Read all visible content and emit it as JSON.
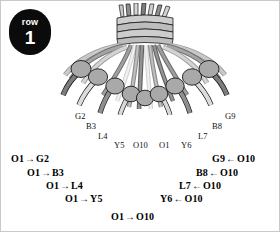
{
  "badge": {
    "word": "row",
    "number": "1"
  },
  "illustration": {
    "name": "friendship-bracelet-knot-fan-diagram",
    "colors": {
      "outline": "#1a1a1a",
      "strand_light": "#d9d9d9",
      "strand_mid": "#9a9a9a",
      "strand_dark": "#6e6e6e",
      "knot_fill": "#a8a8a8",
      "wrap_fill": "#cfcfcf"
    }
  },
  "thread_labels": [
    {
      "text": "G2",
      "x": 74,
      "y": 114
    },
    {
      "text": "B3",
      "x": 85,
      "y": 124
    },
    {
      "text": "L4",
      "x": 97,
      "y": 134
    },
    {
      "text": "Y5",
      "x": 114,
      "y": 143
    },
    {
      "text": "O10",
      "x": 134,
      "y": 143
    },
    {
      "text": "O1",
      "x": 159,
      "y": 143
    },
    {
      "text": "Y6",
      "x": 181,
      "y": 143
    },
    {
      "text": "L7",
      "x": 198,
      "y": 134
    },
    {
      "text": "B8",
      "x": 212,
      "y": 124
    },
    {
      "text": "G9",
      "x": 225,
      "y": 113
    }
  ],
  "instructions_left": [
    {
      "from": "O1",
      "arrow": "→",
      "to": "G2",
      "x": 10,
      "y": 156
    },
    {
      "from": "O1",
      "arrow": "→",
      "to": "B3",
      "x": 26,
      "y": 170
    },
    {
      "from": "O1",
      "arrow": "→",
      "to": "L4",
      "x": 45,
      "y": 183
    },
    {
      "from": "O1",
      "arrow": "→",
      "to": "Y5",
      "x": 64,
      "y": 196
    },
    {
      "from": "O1",
      "arrow": "→",
      "to": "O10",
      "x": 111,
      "y": 214
    }
  ],
  "instructions_right": [
    {
      "from": "G9",
      "arrow": "←",
      "to": "O10",
      "x": 212,
      "y": 156
    },
    {
      "from": "B8",
      "arrow": "←",
      "to": "O10",
      "x": 196,
      "y": 170
    },
    {
      "from": "L7",
      "arrow": "←",
      "to": "O10",
      "x": 179,
      "y": 183
    },
    {
      "from": "Y6",
      "arrow": "←",
      "to": "O10",
      "x": 160,
      "y": 196
    }
  ]
}
